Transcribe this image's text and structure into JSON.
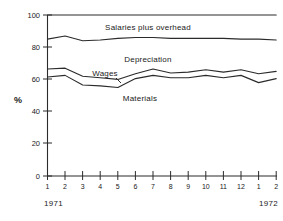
{
  "chart_data": {
    "type": "line",
    "title": "",
    "xlabel": "",
    "ylabel": "%",
    "ylim": [
      0,
      100
    ],
    "yticks": [
      0,
      20,
      40,
      60,
      80,
      100
    ],
    "ytick_labels": [
      "0",
      "20",
      "40",
      "60",
      "80",
      "100"
    ],
    "grid": false,
    "legend_position": "inline-band-labels",
    "x": [
      1,
      2,
      3,
      4,
      5,
      6,
      7,
      8,
      9,
      10,
      11,
      12,
      13,
      14
    ],
    "xtick_labels": [
      "1",
      "2",
      "3",
      "4",
      "5",
      "6",
      "7",
      "8",
      "9",
      "10",
      "11",
      "12",
      "1",
      "2"
    ],
    "x_group_labels": [
      "1971",
      "1972"
    ],
    "annotations": [
      {
        "text": "Salaries plus overhead",
        "x": 4.6,
        "y": 92
      },
      {
        "text": "Depreciation",
        "x": 6.0,
        "y": 75
      },
      {
        "text": "Wages",
        "x": 3.6,
        "y": 64
      },
      {
        "text": "Materials",
        "x": 6.0,
        "y": 52
      }
    ],
    "series": [
      {
        "name": "Salaries plus overhead (upper boundary)",
        "values": [
          100,
          100,
          100,
          100,
          100,
          100,
          100,
          100,
          100,
          100,
          100,
          100,
          100,
          100
        ]
      },
      {
        "name": "Depreciation (upper boundary)",
        "values": [
          85,
          87,
          84,
          84.5,
          85.5,
          86,
          86,
          85.5,
          85.5,
          85.5,
          85.5,
          85,
          85,
          84.5
        ]
      },
      {
        "name": "Wages (upper boundary)",
        "values": [
          66.5,
          67,
          62,
          61,
          60,
          63.5,
          66.5,
          64,
          64.5,
          66,
          64.5,
          66,
          63.5,
          65
        ]
      },
      {
        "name": "Materials (upper boundary)",
        "values": [
          61.5,
          62.5,
          56.5,
          56,
          55,
          60.5,
          62.5,
          61,
          61,
          62.5,
          61,
          62.5,
          58,
          60.5
        ]
      }
    ]
  },
  "labels": {
    "y_axis_title": "%",
    "band_salaries": "Salaries plus overhead",
    "band_depreciation": "Depreciation",
    "band_wages": "Wages",
    "band_materials": "Materials",
    "year_left": "1971",
    "year_right": "1972",
    "y0": "0",
    "y20": "20",
    "y40": "40",
    "y60": "60",
    "y80": "80",
    "y100": "100",
    "x1": "1",
    "x2": "2",
    "x3": "3",
    "x4": "4",
    "x5": "5",
    "x6": "6",
    "x7": "7",
    "x8": "8",
    "x9": "9",
    "x10": "10",
    "x11": "11",
    "x12": "12",
    "x13": "1",
    "x14": "2"
  },
  "colors": {
    "ink": "#2b2b2b",
    "background": "#ffffff"
  }
}
